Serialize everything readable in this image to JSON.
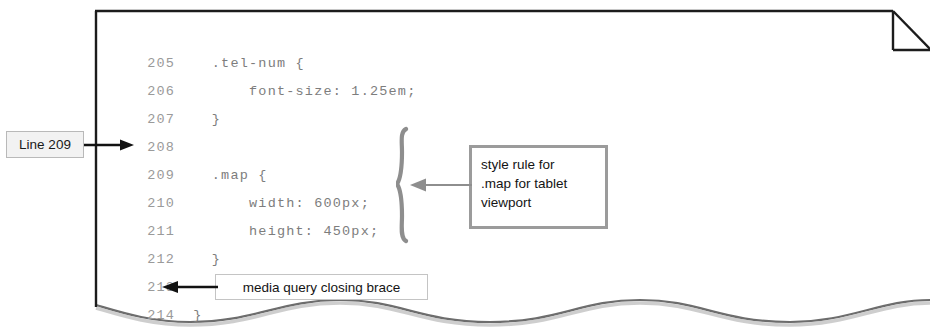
{
  "figure": {
    "type": "annotated-code-listing",
    "page": {
      "background_color": "#ffffff",
      "border_color": "#1c1c1c",
      "has_dogear_fold": true,
      "has_torn_bottom_edge": true
    }
  },
  "code": {
    "language": "css",
    "line_number_color": "#9a9a9a",
    "source_color": "#7d7d7d",
    "lines": [
      {
        "number": "205",
        "text": "  .tel-num {"
      },
      {
        "number": "206",
        "text": "      font-size: 1.25em;"
      },
      {
        "number": "207",
        "text": "  }"
      },
      {
        "number": "208",
        "text": ""
      },
      {
        "number": "209",
        "text": "  .map {"
      },
      {
        "number": "210",
        "text": "      width: 600px;"
      },
      {
        "number": "211",
        "text": "      height: 450px;"
      },
      {
        "number": "212",
        "text": "  }"
      },
      {
        "number": "213",
        "text": ""
      },
      {
        "number": "214",
        "text": "}"
      }
    ]
  },
  "annotations": {
    "line_callout": {
      "label": "Line 209",
      "background_color": "#f2f2f2",
      "border_color": "#b9b9b9",
      "points_to_line": "209"
    },
    "style_rule_note": {
      "lines": [
        "style rule for",
        ".map for tablet",
        "viewport"
      ],
      "border_color": "#9b9b9b",
      "background_color": "#ffffff",
      "points_to_lines": [
        "209",
        "210",
        "211",
        "212"
      ]
    },
    "closing_brace_note": {
      "label": "media query closing brace",
      "border_color": "#c4c4c4",
      "background_color": "#ffffff",
      "points_to_line": "214"
    },
    "group_brace": {
      "glyph": "}",
      "color": "#8e8e8e",
      "spans_lines": [
        "209",
        "212"
      ]
    }
  }
}
